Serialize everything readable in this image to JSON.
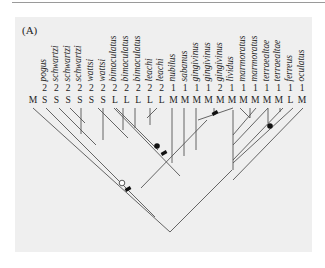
{
  "figure": {
    "panel_label": "(A)",
    "colors": {
      "panel_bg": "#efefef",
      "line": "#555555",
      "text": "#222222",
      "rule": "#9a9a9a"
    }
  },
  "taxa": [
    {
      "name": "",
      "number": "",
      "code": "M"
    },
    {
      "name": "pogus",
      "number": "2",
      "code": "S"
    },
    {
      "name": "schwartzi",
      "number": "2",
      "code": "S"
    },
    {
      "name": "schwartzi",
      "number": "2",
      "code": "S"
    },
    {
      "name": "schwartzi",
      "number": "2",
      "code": "S"
    },
    {
      "name": "wattsi",
      "number": "2",
      "code": "S"
    },
    {
      "name": "wattsi",
      "number": "2",
      "code": "S"
    },
    {
      "name": "bimaculatus",
      "number": "2",
      "code": "L"
    },
    {
      "name": "bimaculatus",
      "number": "2",
      "code": "L"
    },
    {
      "name": "bimaculatus",
      "number": "2",
      "code": "L"
    },
    {
      "name": "leachi",
      "number": "2",
      "code": "L"
    },
    {
      "name": "leachi",
      "number": "2",
      "code": "L"
    },
    {
      "name": "nubilus",
      "number": "1",
      "code": "M"
    },
    {
      "name": "sabanus",
      "number": "1",
      "code": "M"
    },
    {
      "name": "gingivinus",
      "number": "1",
      "code": "M"
    },
    {
      "name": "gingivinus",
      "number": "1",
      "code": "M"
    },
    {
      "name": "gingivinus",
      "number": "2",
      "code": "M"
    },
    {
      "name": "lividus",
      "number": "1",
      "code": "M"
    },
    {
      "name": "marmoratus",
      "number": "1",
      "code": "M"
    },
    {
      "name": "marmoratus",
      "number": "1",
      "code": "M"
    },
    {
      "name": "terraealtae",
      "number": "1",
      "code": "M"
    },
    {
      "name": "terraealtae",
      "number": "1",
      "code": "M"
    },
    {
      "name": "ferreus",
      "number": "1",
      "code": "L"
    },
    {
      "name": "oculatus",
      "number": "1",
      "code": "M"
    }
  ],
  "tree": {
    "lines": [
      [
        33,
        108,
        170,
        232
      ],
      [
        46,
        108,
        155,
        217
      ],
      [
        59,
        108,
        96,
        145
      ],
      [
        70,
        108,
        85,
        123
      ],
      [
        81,
        108,
        81,
        134
      ],
      [
        103,
        108,
        103,
        140
      ],
      [
        98,
        108,
        128,
        138
      ],
      [
        116,
        108,
        158,
        150
      ],
      [
        123,
        108,
        123,
        130
      ],
      [
        135,
        108,
        135,
        128
      ],
      [
        150,
        108,
        150,
        125
      ],
      [
        157,
        108,
        147,
        118
      ],
      [
        141,
        188,
        207,
        120
      ],
      [
        170,
        232,
        232,
        170
      ],
      [
        114,
        108,
        180,
        176
      ],
      [
        172,
        108,
        172,
        163
      ],
      [
        184,
        108,
        184,
        156
      ],
      [
        196,
        108,
        196,
        150
      ],
      [
        214,
        108,
        214,
        113
      ],
      [
        198,
        120,
        233,
        108
      ],
      [
        233,
        170,
        233,
        110
      ],
      [
        233,
        160,
        283,
        108
      ],
      [
        233,
        145,
        268,
        108
      ],
      [
        233,
        135,
        256,
        108
      ],
      [
        233,
        180,
        303,
        108
      ],
      [
        233,
        163,
        293,
        108
      ],
      [
        250,
        118,
        240,
        108
      ],
      [
        250,
        118,
        250,
        108
      ],
      [
        268,
        123,
        268,
        108
      ],
      [
        280,
        112,
        280,
        108
      ]
    ],
    "markers": [
      {
        "type": "filled-circle",
        "cx": 157,
        "cy": 146,
        "r": 2.8
      },
      {
        "type": "bar",
        "cx": 164,
        "cy": 153
      },
      {
        "type": "bar",
        "cx": 215,
        "cy": 113
      },
      {
        "type": "open-circle",
        "cx": 122,
        "cy": 183,
        "r": 2.8
      },
      {
        "type": "bar",
        "cx": 128,
        "cy": 189
      },
      {
        "type": "filled-circle",
        "cx": 270,
        "cy": 126,
        "r": 2.8
      }
    ]
  }
}
